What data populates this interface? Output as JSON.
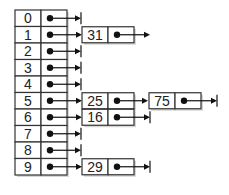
{
  "diagram": {
    "type": "hash-table-separate-chaining",
    "colors": {
      "stroke": "#333333",
      "fill": "#ffffff",
      "text": "#222222"
    },
    "buckets": [
      {
        "index": "0",
        "chain": []
      },
      {
        "index": "1",
        "chain": [
          "31"
        ]
      },
      {
        "index": "2",
        "chain": []
      },
      {
        "index": "3",
        "chain": []
      },
      {
        "index": "4",
        "chain": []
      },
      {
        "index": "5",
        "chain": [
          "25",
          "75"
        ]
      },
      {
        "index": "6",
        "chain": [
          "16"
        ]
      },
      {
        "index": "7",
        "chain": []
      },
      {
        "index": "8",
        "chain": []
      },
      {
        "index": "9",
        "chain": [
          "29"
        ]
      }
    ]
  }
}
